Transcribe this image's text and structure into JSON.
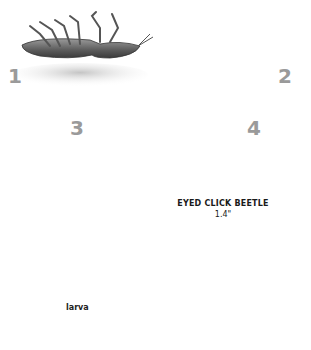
{
  "illustration": {
    "subject": "eyed click beetle flipping sequence",
    "steps": [
      {
        "number": "1",
        "description": "beetle lying on its back"
      },
      {
        "number": "2",
        "description": "beetle arches body on its back"
      },
      {
        "number": "3",
        "description": "beetle snaps and launches into the air"
      },
      {
        "number": "4",
        "description": "beetle lands upright on its legs"
      }
    ],
    "arrows": {
      "count": 5,
      "direction": "arc from step 3 to step 4"
    },
    "species_label": "EYED CLICK BEETLE",
    "size_label": "1.4\"",
    "larva_label": "larva",
    "colors": {
      "background": "#ffffff",
      "step_number": "#9a9a9a",
      "shadow": "#d4d4d4",
      "soil_dark": "#3a3a3a",
      "soil_light": "#8a8a8a",
      "beetle_body": "#4a4a4a",
      "larva": "#d8d8d8",
      "backdrop": "#e6e6e6"
    }
  }
}
